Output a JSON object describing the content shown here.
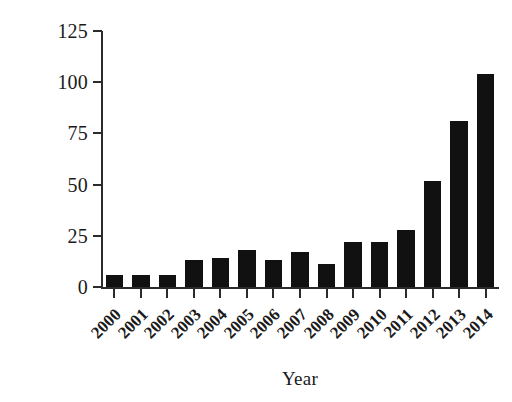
{
  "chart_data": {
    "type": "bar",
    "title": "",
    "xlabel": "Year",
    "ylabel": "# Publications",
    "categories": [
      "2000",
      "2001",
      "2002",
      "2003",
      "2004",
      "2005",
      "2006",
      "2007",
      "2008",
      "2009",
      "2010",
      "2011",
      "2012",
      "2013",
      "2014"
    ],
    "values": [
      6,
      6,
      6,
      13,
      14,
      18,
      13,
      17,
      11,
      22,
      22,
      28,
      52,
      81,
      104
    ],
    "ylim": [
      0,
      125
    ],
    "yticks": [
      0,
      25,
      50,
      75,
      100,
      125
    ],
    "ytick_labels": [
      "0",
      "25",
      "50",
      "75",
      "100",
      "125"
    ],
    "grid": false,
    "legend": false,
    "bar_color": "#111111",
    "axis_color": "#2b2b2b",
    "background_color": "#ffffff",
    "xtick_label_rotation": -45
  },
  "axes": {
    "y_title": "# Publications",
    "x_title": "Year"
  }
}
